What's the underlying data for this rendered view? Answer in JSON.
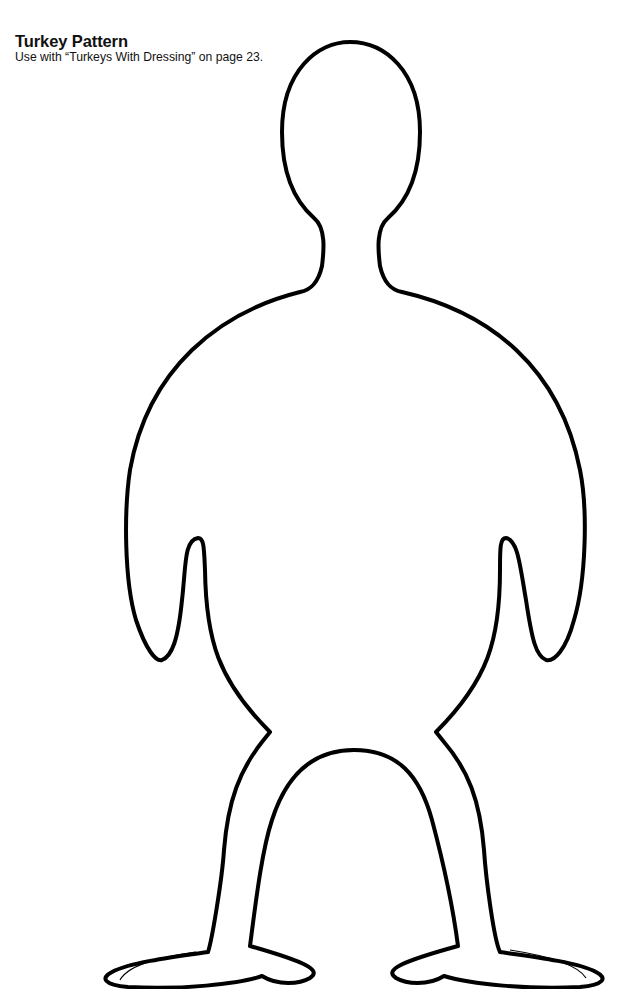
{
  "header": {
    "title": "Turkey Pattern",
    "subtitle": "Use with “Turkeys With Dressing” on page 23."
  },
  "pattern": {
    "shape": "turkey-outline",
    "stroke_color": "#000000",
    "fill_color": "#ffffff",
    "background": "#ffffff"
  }
}
